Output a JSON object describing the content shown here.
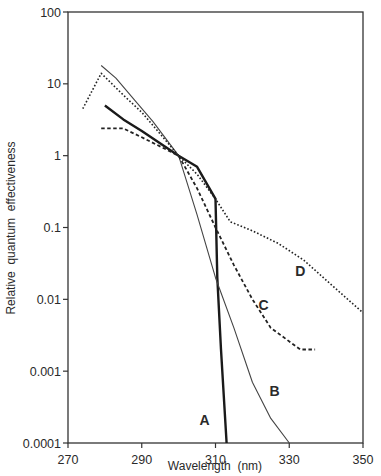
{
  "chart_data": {
    "type": "line",
    "title": "",
    "xlabel": "Wavelength  (nm)",
    "ylabel": "Relative  quantum  effectiveness",
    "xlim": [
      270,
      350
    ],
    "ylim": [
      0.0001,
      100
    ],
    "yscale": "log",
    "grid": false,
    "legend_position": "inline labels",
    "x_ticks": [
      270,
      290,
      310,
      330,
      350
    ],
    "x_tick_labels": [
      "270",
      "290",
      "310",
      "330",
      "350"
    ],
    "y_ticks": [
      100,
      10,
      1,
      0.1,
      0.01,
      0.001,
      0.0001
    ],
    "y_tick_labels": [
      "100",
      "10",
      "1",
      "0.1",
      "0.01",
      "0.001",
      "0.0001"
    ],
    "series": [
      {
        "name": "A",
        "style": "thick-solid",
        "points": [
          [
            280,
            5
          ],
          [
            285,
            3.2
          ],
          [
            290,
            2.2
          ],
          [
            300,
            1.0
          ],
          [
            305,
            0.7
          ],
          [
            310,
            0.25
          ],
          [
            310.5,
            0.02
          ],
          [
            311.5,
            0.002
          ],
          [
            313,
            0.0001
          ]
        ],
        "label_pos": [
          307,
          0.00018
        ]
      },
      {
        "name": "B",
        "style": "thin-solid",
        "points": [
          [
            279,
            18
          ],
          [
            283,
            12
          ],
          [
            288,
            6
          ],
          [
            293,
            3
          ],
          [
            300,
            1.0
          ],
          [
            305,
            0.15
          ],
          [
            310,
            0.02
          ],
          [
            315,
            0.004
          ],
          [
            320,
            0.0007
          ],
          [
            325,
            0.00022
          ],
          [
            330,
            0.0001
          ]
        ],
        "label_pos": [
          326,
          0.00045
        ]
      },
      {
        "name": "C",
        "style": "dashed",
        "points": [
          [
            279,
            2.4
          ],
          [
            285,
            2.4
          ],
          [
            290,
            1.8
          ],
          [
            300,
            1.0
          ],
          [
            305,
            0.35
          ],
          [
            310,
            0.1
          ],
          [
            315,
            0.03
          ],
          [
            320,
            0.01
          ],
          [
            325,
            0.004
          ],
          [
            333,
            0.002
          ],
          [
            337,
            0.002
          ]
        ],
        "label_pos": [
          323,
          0.007
        ]
      },
      {
        "name": "D",
        "style": "dotted",
        "points": [
          [
            274,
            4.5
          ],
          [
            279,
            14
          ],
          [
            285,
            7
          ],
          [
            290,
            4
          ],
          [
            295,
            2
          ],
          [
            300,
            1.0
          ],
          [
            305,
            0.55
          ],
          [
            310,
            0.25
          ],
          [
            314,
            0.12
          ],
          [
            320,
            0.09
          ],
          [
            327,
            0.06
          ],
          [
            334,
            0.035
          ],
          [
            342,
            0.015
          ],
          [
            350,
            0.0065
          ]
        ],
        "label_pos": [
          333,
          0.021
        ]
      }
    ]
  }
}
